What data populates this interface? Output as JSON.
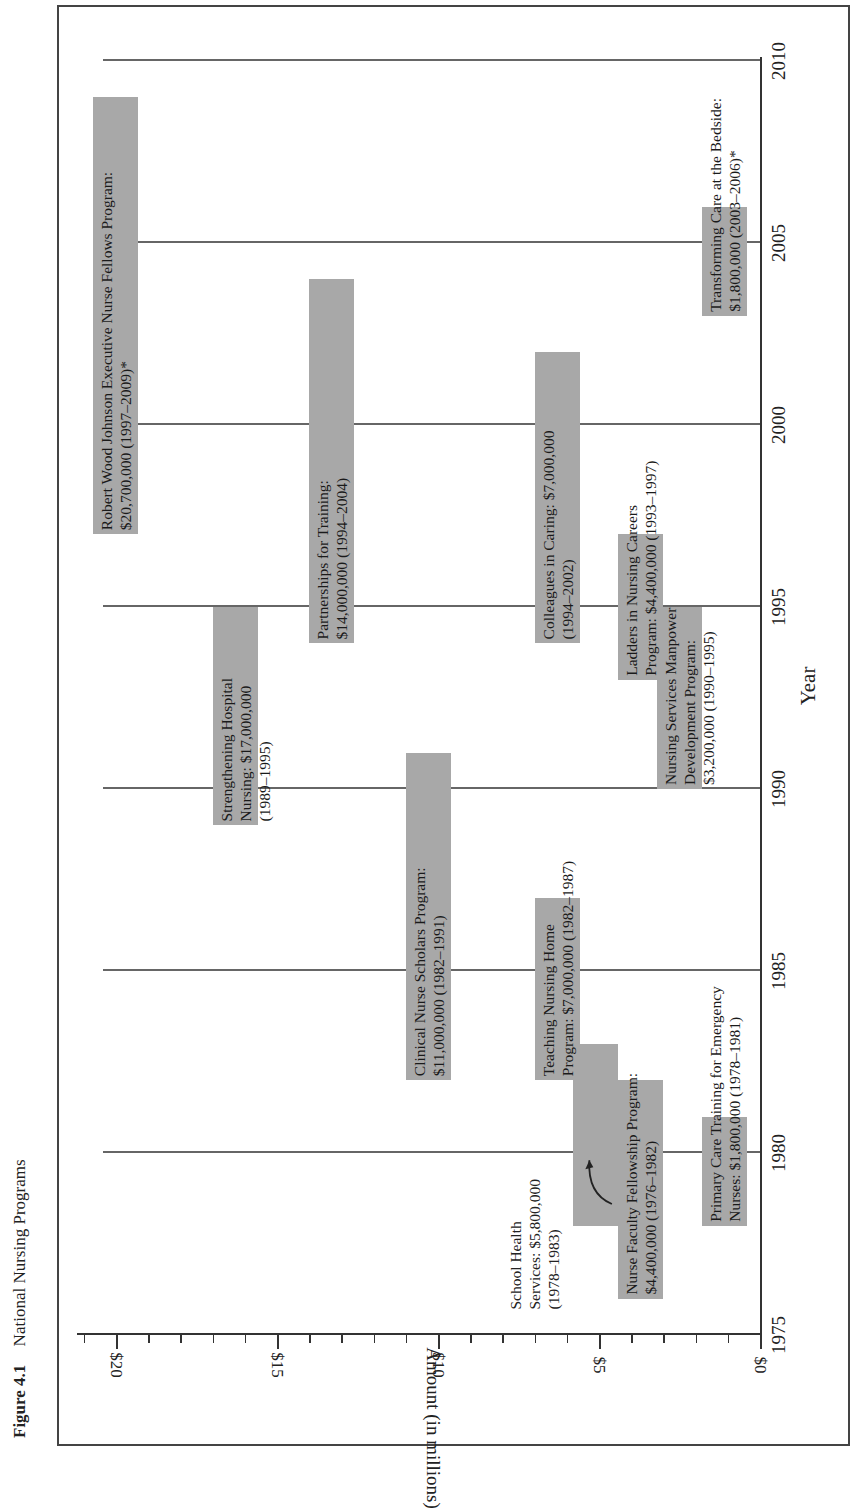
{
  "caption": {
    "figure_number": "Figure 4.1",
    "title": "National Nursing Programs"
  },
  "chart_data": {
    "type": "bar",
    "subtype": "floating-range (Gantt-style), figure rotated 90° counter-clockwise",
    "title": "National Nursing Programs",
    "xlabel": "Year",
    "ylabel": "Amount (in millions)",
    "xlim": [
      1975,
      2010
    ],
    "ylim": [
      0,
      21
    ],
    "x_ticks": [
      1975,
      1980,
      1985,
      1990,
      1995,
      2000,
      2005,
      2010
    ],
    "y_ticks": [
      0,
      5,
      10,
      15,
      20
    ],
    "y_tick_labels": [
      "$0",
      "$5",
      "$10",
      "$15",
      "$20"
    ],
    "y_minor_tick_step": 1,
    "grid": "vertical lines at each 5-year tick",
    "series": [
      {
        "name": "Nurse Faculty Fellowship Program",
        "amount_millions": 4.4,
        "amount": "$4,400,000",
        "start": 1976,
        "end": 1982,
        "label": "Nurse Faculty Fellowship Program:\n$4,400,000 (1976–1982)"
      },
      {
        "name": "Primary Care Training for Emergency Nurses",
        "amount_millions": 1.8,
        "amount": "$1,800,000",
        "start": 1978,
        "end": 1981,
        "label": "Primary Care Training for Emergency\nNurses: $1,800,000 (1978–1981)"
      },
      {
        "name": "School Health Services",
        "amount_millions": 5.8,
        "amount": "$5,800,000",
        "start": 1978,
        "end": 1983,
        "label": "School Health\nServices: $5,800,000\n(1978–1983)"
      },
      {
        "name": "Teaching Nursing Home Program",
        "amount_millions": 7.0,
        "amount": "$7,000,000",
        "start": 1982,
        "end": 1987,
        "label": "Teaching Nursing Home\nProgram: $7,000,000 (1982–1987)"
      },
      {
        "name": "Clinical Nurse Scholars Program",
        "amount_millions": 11.0,
        "amount": "$11,000,000",
        "start": 1982,
        "end": 1991,
        "label": "Clinical Nurse Scholars Program:\n$11,000,000 (1982–1991)"
      },
      {
        "name": "Strengthening Hospital Nursing",
        "amount_millions": 17.0,
        "amount": "$17,000,000",
        "start": 1989,
        "end": 1995,
        "label": "Strengthening Hospital\nNursing: $17,000,000\n(1989–1995)"
      },
      {
        "name": "Nursing Services Manpower Development Program",
        "amount_millions": 3.2,
        "amount": "$3,200,000",
        "start": 1990,
        "end": 1995,
        "label": "Nursing Services Manpower\nDevelopment Program:\n$3,200,000 (1990–1995)"
      },
      {
        "name": "Ladders in Nursing Careers Program",
        "amount_millions": 4.4,
        "amount": "$4,400,000",
        "start": 1993,
        "end": 1997,
        "label": "Ladders in Nursing Careers\nProgram: $4,400,000 (1993–1997)"
      },
      {
        "name": "Partnerships for Training",
        "amount_millions": 14.0,
        "amount": "$14,000,000",
        "start": 1994,
        "end": 2004,
        "label": "Partnerships for Training:\n$14,000,000 (1994–2004)"
      },
      {
        "name": "Colleagues in Caring",
        "amount_millions": 7.0,
        "amount": "$7,000,000",
        "start": 1994,
        "end": 2002,
        "label": "Colleagues in Caring: $7,000,000\n(1994–2002)"
      },
      {
        "name": "Robert Wood Johnson Executive Nurse Fellows Program",
        "amount_millions": 20.7,
        "amount": "$20,700,000",
        "start": 1997,
        "end": 2009,
        "label": "Robert Wood Johnson Executive Nurse Fellows Program:\n$20,700,000 (1997–2009)*"
      },
      {
        "name": "Transforming Care at the Bedside",
        "amount_millions": 1.8,
        "amount": "$1,800,000",
        "start": 2003,
        "end": 2006,
        "label": "Transforming Care at the Bedside:\n$1,800,000 (2003–2006)*"
      }
    ],
    "annotations": [
      {
        "text": "School Health\nServices: $5,800,000\n(1978–1983)",
        "arrow_to": "School Health Services bar"
      }
    ],
    "colors": {
      "bar": "#a8a8a8",
      "axis": "#333333",
      "grid": "#666666",
      "frame": "#444444"
    }
  }
}
